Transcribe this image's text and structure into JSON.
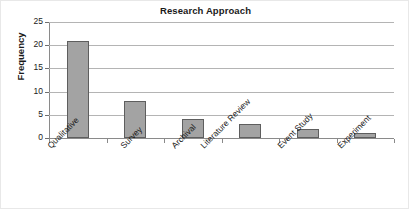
{
  "chart_data": {
    "type": "bar",
    "title": "Research Approach",
    "xlabel": "",
    "ylabel": "Frequency",
    "categories": [
      "Qualitative",
      "Survey",
      "Archival",
      "Literature Review",
      "Event Study",
      "Experiment"
    ],
    "values": [
      21,
      8,
      4,
      3,
      2,
      1
    ],
    "ylim": [
      0,
      25
    ],
    "ytick_labels": [
      "25",
      "20",
      "15",
      "10",
      "5",
      "0"
    ],
    "ytick_values": [
      25,
      20,
      15,
      10,
      5,
      0
    ],
    "grid": "horizontal",
    "legend": "none",
    "bar_color": "#a3a3a3",
    "bar_border_color": "#5e5e5e",
    "gridline_color": "#b4b4b4",
    "axis_color": "#8a8a8a",
    "text_color": "#1a1a1a",
    "background": "#ffffff"
  }
}
